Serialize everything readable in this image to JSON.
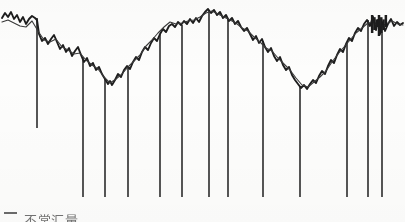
{
  "figure": {
    "kind": "scanned-line-chart",
    "background_color": "#fdfdfc",
    "ink_color": "#1d1d1d",
    "secondary_ink_color": "#3a3a3a",
    "spike_color": "#2b2b2b",
    "width_px": 405,
    "height_px": 222
  },
  "legend": {
    "position": "bottom-left",
    "entries": [
      {
        "marker": "short-horizontal-line",
        "marker_color": "#6b6b6b",
        "label": "不常汇量",
        "label_note": "bottom-cropped CJK caption, only upper strokes legible"
      }
    ]
  },
  "chart_data": {
    "type": "line",
    "title": "",
    "subtitle": "",
    "xlabel": "",
    "ylabel": "",
    "grid": false,
    "legend_position": "bottom-left",
    "axes_visible": false,
    "tick_labels_x": [],
    "tick_labels_y": [],
    "xlim": [
      0,
      405
    ],
    "ylim": [
      0,
      205
    ],
    "y_direction": "value-up",
    "note": "Axis scales are not printed on the scan; x/y are given in pixel coordinates of the plot box. y values are pixel rows measured from the top, so smaller y = higher value.",
    "series": [
      {
        "name": "series-noisy-primary",
        "role": "primary",
        "style": "solid-thick-noisy",
        "color": "#1d1d1d",
        "width_px": 1.9,
        "points": [
          [
            2,
            18
          ],
          [
            5,
            13
          ],
          [
            8,
            17
          ],
          [
            11,
            12
          ],
          [
            14,
            19
          ],
          [
            17,
            15
          ],
          [
            20,
            22
          ],
          [
            23,
            17
          ],
          [
            26,
            24
          ],
          [
            29,
            19
          ],
          [
            32,
            16
          ],
          [
            35,
            18
          ],
          [
            37,
            20
          ],
          [
            39,
            34
          ],
          [
            42,
            41
          ],
          [
            45,
            38
          ],
          [
            48,
            44
          ],
          [
            51,
            39
          ],
          [
            54,
            35
          ],
          [
            57,
            42
          ],
          [
            60,
            49
          ],
          [
            63,
            45
          ],
          [
            66,
            52
          ],
          [
            69,
            48
          ],
          [
            72,
            56
          ],
          [
            75,
            51
          ],
          [
            78,
            47
          ],
          [
            81,
            55
          ],
          [
            84,
            62
          ],
          [
            87,
            58
          ],
          [
            90,
            66
          ],
          [
            93,
            63
          ],
          [
            96,
            70
          ],
          [
            99,
            67
          ],
          [
            102,
            74
          ],
          [
            105,
            79
          ],
          [
            108,
            84
          ],
          [
            110,
            81
          ],
          [
            112,
            85
          ],
          [
            115,
            80
          ],
          [
            118,
            74
          ],
          [
            121,
            77
          ],
          [
            124,
            70
          ],
          [
            127,
            66
          ],
          [
            130,
            69
          ],
          [
            133,
            62
          ],
          [
            136,
            57
          ],
          [
            139,
            60
          ],
          [
            142,
            52
          ],
          [
            145,
            47
          ],
          [
            148,
            50
          ],
          [
            151,
            43
          ],
          [
            154,
            38
          ],
          [
            157,
            41
          ],
          [
            160,
            34
          ],
          [
            163,
            29
          ],
          [
            166,
            32
          ],
          [
            169,
            26
          ],
          [
            172,
            24
          ],
          [
            175,
            27
          ],
          [
            178,
            22
          ],
          [
            181,
            25
          ],
          [
            184,
            21
          ],
          [
            187,
            24
          ],
          [
            190,
            19
          ],
          [
            193,
            23
          ],
          [
            196,
            18
          ],
          [
            199,
            22
          ],
          [
            202,
            16
          ],
          [
            205,
            12
          ],
          [
            208,
            9
          ],
          [
            211,
            13
          ],
          [
            214,
            10
          ],
          [
            217,
            15
          ],
          [
            220,
            12
          ],
          [
            223,
            18
          ],
          [
            226,
            15
          ],
          [
            229,
            21
          ],
          [
            232,
            18
          ],
          [
            235,
            24
          ],
          [
            238,
            21
          ],
          [
            241,
            27
          ],
          [
            244,
            31
          ],
          [
            247,
            28
          ],
          [
            250,
            34
          ],
          [
            253,
            40
          ],
          [
            256,
            36
          ],
          [
            259,
            43
          ],
          [
            262,
            39
          ],
          [
            265,
            47
          ],
          [
            268,
            52
          ],
          [
            271,
            48
          ],
          [
            274,
            56
          ],
          [
            277,
            61
          ],
          [
            280,
            57
          ],
          [
            283,
            65
          ],
          [
            286,
            70
          ],
          [
            289,
            67
          ],
          [
            292,
            75
          ],
          [
            295,
            80
          ],
          [
            298,
            84
          ],
          [
            301,
            88
          ],
          [
            304,
            85
          ],
          [
            307,
            89
          ],
          [
            310,
            84
          ],
          [
            313,
            80
          ],
          [
            316,
            83
          ],
          [
            319,
            76
          ],
          [
            322,
            71
          ],
          [
            325,
            74
          ],
          [
            328,
            66
          ],
          [
            331,
            60
          ],
          [
            334,
            63
          ],
          [
            337,
            55
          ],
          [
            340,
            49
          ],
          [
            343,
            52
          ],
          [
            346,
            44
          ],
          [
            349,
            38
          ],
          [
            352,
            41
          ],
          [
            355,
            33
          ],
          [
            358,
            28
          ],
          [
            361,
            31
          ],
          [
            364,
            24
          ],
          [
            367,
            20
          ],
          [
            370,
            26
          ],
          [
            373,
            17
          ],
          [
            376,
            30
          ],
          [
            378,
            20
          ],
          [
            380,
            34
          ],
          [
            382,
            22
          ],
          [
            385,
            31
          ],
          [
            388,
            24
          ],
          [
            391,
            19
          ],
          [
            394,
            26
          ],
          [
            397,
            22
          ],
          [
            400,
            25
          ],
          [
            403,
            23
          ]
        ]
      },
      {
        "name": "series-smooth-secondary",
        "role": "secondary",
        "style": "solid-thin",
        "color": "#3a3a3a",
        "width_px": 1.1,
        "points": [
          [
            2,
            22
          ],
          [
            8,
            20
          ],
          [
            14,
            23
          ],
          [
            20,
            26
          ],
          [
            26,
            27
          ],
          [
            32,
            21
          ],
          [
            38,
            31
          ],
          [
            44,
            40
          ],
          [
            50,
            42
          ],
          [
            56,
            39
          ],
          [
            62,
            47
          ],
          [
            68,
            50
          ],
          [
            74,
            54
          ],
          [
            80,
            53
          ],
          [
            86,
            60
          ],
          [
            92,
            65
          ],
          [
            98,
            69
          ],
          [
            104,
            77
          ],
          [
            110,
            83
          ],
          [
            116,
            79
          ],
          [
            122,
            74
          ],
          [
            128,
            67
          ],
          [
            134,
            61
          ],
          [
            140,
            55
          ],
          [
            146,
            46
          ],
          [
            152,
            40
          ],
          [
            158,
            33
          ],
          [
            164,
            27
          ],
          [
            170,
            22
          ],
          [
            176,
            24
          ],
          [
            182,
            23
          ],
          [
            188,
            21
          ],
          [
            194,
            20
          ],
          [
            200,
            17
          ],
          [
            206,
            13
          ],
          [
            212,
            11
          ],
          [
            218,
            14
          ],
          [
            224,
            17
          ],
          [
            230,
            20
          ],
          [
            236,
            23
          ],
          [
            242,
            28
          ],
          [
            248,
            31
          ],
          [
            254,
            37
          ],
          [
            260,
            42
          ],
          [
            266,
            48
          ],
          [
            272,
            51
          ],
          [
            278,
            58
          ],
          [
            284,
            64
          ],
          [
            290,
            70
          ],
          [
            296,
            78
          ],
          [
            302,
            85
          ],
          [
            308,
            87
          ],
          [
            314,
            82
          ],
          [
            320,
            77
          ],
          [
            326,
            71
          ],
          [
            332,
            62
          ],
          [
            338,
            54
          ],
          [
            344,
            47
          ],
          [
            350,
            40
          ],
          [
            356,
            33
          ],
          [
            362,
            28
          ],
          [
            368,
            23
          ],
          [
            374,
            22
          ],
          [
            380,
            27
          ],
          [
            386,
            24
          ],
          [
            392,
            21
          ],
          [
            398,
            24
          ],
          [
            403,
            25
          ]
        ]
      }
    ],
    "vertical_markers": {
      "name": "event-spike-lines",
      "description": "Thin vertical rules dropped from the curve toward the bottom of the plot, marking discrete events.",
      "color": "#2b2b2b",
      "width_px": 1.6,
      "bottom_y": 198,
      "items": [
        {
          "x": 37,
          "top_y": 18,
          "bottom_y": 128
        },
        {
          "x": 83,
          "top_y": 57,
          "bottom_y": 197
        },
        {
          "x": 105,
          "top_y": 79,
          "bottom_y": 197
        },
        {
          "x": 128,
          "top_y": 66,
          "bottom_y": 197
        },
        {
          "x": 160,
          "top_y": 34,
          "bottom_y": 197
        },
        {
          "x": 182,
          "top_y": 25,
          "bottom_y": 197
        },
        {
          "x": 209,
          "top_y": 10,
          "bottom_y": 197
        },
        {
          "x": 228,
          "top_y": 19,
          "bottom_y": 197
        },
        {
          "x": 263,
          "top_y": 41,
          "bottom_y": 197
        },
        {
          "x": 300,
          "top_y": 86,
          "bottom_y": 197
        },
        {
          "x": 347,
          "top_y": 43,
          "bottom_y": 197
        },
        {
          "x": 368,
          "top_y": 20,
          "bottom_y": 197
        },
        {
          "x": 382,
          "top_y": 22,
          "bottom_y": 197
        }
      ]
    },
    "dense_regions": [
      {
        "name": "high-volatility-blob",
        "x_range": [
          371,
          387
        ],
        "y_range": [
          15,
          36
        ],
        "description": "Saturated ink cluster where the two traces overlap with large oscillation."
      }
    ]
  }
}
